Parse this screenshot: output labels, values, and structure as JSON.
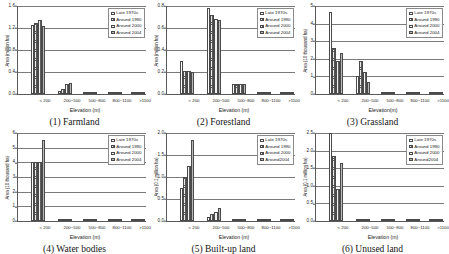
{
  "figure": {
    "series_names": [
      "Late 1970s",
      "Around 1990",
      "Around 2000",
      "Around 2004"
    ],
    "categories": [
      "< 200",
      "200~500",
      "500~800",
      "800~1100",
      ">1100"
    ]
  },
  "chart_data": [
    {
      "type": "bar",
      "panel_id": "1",
      "title": "(1) Farmland",
      "xlabel": "Elevation (m)",
      "ylabel": "Area (million ha)",
      "categories": [
        "< 200",
        "200~500",
        "500~800",
        "800~1100",
        ">1100"
      ],
      "legend": [
        "Late 1970s",
        "Around 1990",
        "Around 2000",
        "Around 2004"
      ],
      "legend_position": "top-right",
      "grid": true,
      "ylim": [
        0,
        1.6
      ],
      "yticks": [
        0.0,
        0.4,
        0.8,
        1.2,
        1.6
      ],
      "ytick_labels": [
        "0.0",
        "0.4",
        "0.8",
        "1.2",
        "1.6"
      ],
      "series": [
        {
          "name": "Late 1970s",
          "values": [
            1.25,
            0.05,
            0.0,
            0.0,
            0.0
          ]
        },
        {
          "name": "Around 1990",
          "values": [
            1.3,
            0.09,
            0.0,
            0.0,
            0.0
          ]
        },
        {
          "name": "Around 2000",
          "values": [
            1.35,
            0.19,
            0.0,
            0.0,
            0.0
          ]
        },
        {
          "name": "Around 2004",
          "values": [
            1.24,
            0.2,
            0.0,
            0.0,
            0.0
          ]
        }
      ]
    },
    {
      "type": "bar",
      "panel_id": "2",
      "title": "(2) Forestland",
      "xlabel": "Elevation (m)",
      "ylabel": "Area (million ha)",
      "categories": [
        "< 200",
        "200~500",
        "500~800",
        "800~1100",
        ">1100"
      ],
      "legend": [
        "Late 1970s",
        "Around 1990",
        "Around 2000",
        "Around 2004"
      ],
      "legend_position": "top-right",
      "grid": true,
      "ylim": [
        0,
        0.8
      ],
      "yticks": [
        0.0,
        0.2,
        0.4,
        0.6,
        0.8
      ],
      "ytick_labels": [
        "0.0",
        "0.2",
        "0.4",
        "0.6",
        "0.8"
      ],
      "series": [
        {
          "name": "Late 1970s",
          "values": [
            0.3,
            0.78,
            0.09,
            0.0,
            0.0
          ]
        },
        {
          "name": "Around 1990",
          "values": [
            0.21,
            0.72,
            0.09,
            0.0,
            0.0
          ]
        },
        {
          "name": "Around 2000",
          "values": [
            0.21,
            0.68,
            0.09,
            0.0,
            0.0
          ]
        },
        {
          "name": "Around 2004",
          "values": [
            0.2,
            0.67,
            0.09,
            0.0,
            0.0
          ]
        }
      ]
    },
    {
      "type": "bar",
      "panel_id": "3",
      "title": "(3) Grassland",
      "xlabel": "Elevation(m)",
      "ylabel": "Area (10 thousand ha)",
      "categories": [
        "< 200",
        "200~500",
        "500~800",
        "800~1100",
        ">1100"
      ],
      "legend": [
        "Late 1970s",
        "Around 1990",
        "Around 2000",
        "Around 2004"
      ],
      "legend_position": "top-right",
      "grid": true,
      "ylim": [
        0,
        5
      ],
      "yticks": [
        0,
        1,
        2,
        3,
        4,
        5
      ],
      "ytick_labels": [
        "0",
        "1",
        "2",
        "3",
        "4",
        "5"
      ],
      "series": [
        {
          "name": "Late 1970s",
          "values": [
            4.65,
            1.0,
            0.05,
            0.0,
            0.0
          ]
        },
        {
          "name": "Around 1990",
          "values": [
            2.6,
            1.85,
            0.05,
            0.0,
            0.0
          ]
        },
        {
          "name": "Around 2000",
          "values": [
            1.9,
            1.25,
            0.05,
            0.0,
            0.0
          ]
        },
        {
          "name": "Around 2004",
          "values": [
            2.35,
            0.7,
            0.05,
            0.0,
            0.0
          ]
        }
      ]
    },
    {
      "type": "bar",
      "panel_id": "4",
      "title": "(4) Water bodies",
      "xlabel": "Elevation (m)",
      "ylabel": "Area (10 thousand ha)",
      "categories": [
        "< 200",
        "200~500",
        "500~800",
        "800~1100",
        ">1100"
      ],
      "legend": [
        "Late 1970s",
        "Around 1990",
        "Around 2000",
        "Around 2004"
      ],
      "legend_position": "top-right",
      "grid": true,
      "ylim": [
        0,
        6
      ],
      "yticks": [
        0,
        1,
        2,
        3,
        4,
        5,
        6
      ],
      "ytick_labels": [
        "0",
        "1",
        "2",
        "3",
        "4",
        "5",
        "6"
      ],
      "series": [
        {
          "name": "Late 1970s",
          "values": [
            4.0,
            0.06,
            0.0,
            0.0,
            0.0
          ]
        },
        {
          "name": "Around 1990",
          "values": [
            4.0,
            0.06,
            0.0,
            0.0,
            0.0
          ]
        },
        {
          "name": "Around 2000",
          "values": [
            4.0,
            0.06,
            0.0,
            0.0,
            0.0
          ]
        },
        {
          "name": "Around 2004",
          "values": [
            5.5,
            0.06,
            0.0,
            0.0,
            0.0
          ]
        }
      ]
    },
    {
      "type": "bar",
      "panel_id": "5",
      "title": "(5) Built-up land",
      "xlabel": "Elevation (m)",
      "ylabel": "Area (0.1 million ha)",
      "categories": [
        "< 200",
        "200~500",
        "500~800",
        "800~1100",
        ">1100"
      ],
      "legend": [
        "Late 1970s",
        "Around 1990",
        "Around 2000",
        "Around2004"
      ],
      "legend_position": "top-right",
      "grid": true,
      "ylim": [
        0,
        2.0
      ],
      "yticks": [
        0.0,
        0.5,
        1.0,
        1.5,
        2.0
      ],
      "ytick_labels": [
        "0.0",
        "0.5",
        "1.0",
        "1.5",
        "2.0"
      ],
      "series": [
        {
          "name": "Late 1970s",
          "values": [
            0.75,
            0.1,
            0.0,
            0.0,
            0.0
          ]
        },
        {
          "name": "Around 1990",
          "values": [
            1.0,
            0.15,
            0.0,
            0.0,
            0.0
          ]
        },
        {
          "name": "Around 2000",
          "values": [
            1.25,
            0.2,
            0.0,
            0.0,
            0.0
          ]
        },
        {
          "name": "Around2004",
          "values": [
            1.85,
            0.3,
            0.0,
            0.0,
            0.0
          ]
        }
      ]
    },
    {
      "type": "bar",
      "panel_id": "6",
      "title": "(6) Unused land",
      "xlabel": "Elevation (m)",
      "ylabel": "Area (0.1 million ha)",
      "categories": [
        "< 200",
        "200~500",
        "500~800",
        "800~1100",
        ">1100"
      ],
      "legend": [
        "Late 1970s",
        "Around 1990",
        "Around 2000",
        "Around2004"
      ],
      "legend_position": "top-right",
      "grid": true,
      "ylim": [
        0,
        2.5
      ],
      "yticks": [
        0.0,
        0.5,
        1.0,
        1.5,
        2.0,
        2.5
      ],
      "ytick_labels": [
        "0.0",
        "0.5",
        "1.0",
        "1.5",
        "2.0",
        "2.5"
      ],
      "series": [
        {
          "name": "Late 1970s",
          "values": [
            2.5,
            0.07,
            0.0,
            0.0,
            0.0
          ]
        },
        {
          "name": "Around 1990",
          "values": [
            1.85,
            0.07,
            0.0,
            0.0,
            0.0
          ]
        },
        {
          "name": "Around 2000",
          "values": [
            0.9,
            0.07,
            0.0,
            0.0,
            0.0
          ]
        },
        {
          "name": "Around2004",
          "values": [
            1.65,
            0.07,
            0.0,
            0.0,
            0.0
          ]
        }
      ]
    }
  ]
}
